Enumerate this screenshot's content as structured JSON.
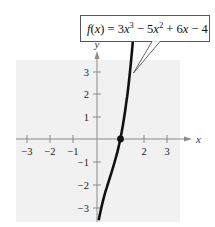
{
  "chart_data": {
    "type": "line",
    "title": "",
    "function_label": "f(x) = 3x^3 − 5x^2 + 6x − 4",
    "function_label_parts": {
      "lhs": "f(x) = 3x",
      "exp1": "3",
      "mid": " − 5x",
      "exp2": "2",
      "rhs": " + 6x − 4"
    },
    "xlabel": "x",
    "ylabel": "y",
    "xlim": [
      -3.5,
      4
    ],
    "ylim": [
      -3.5,
      4
    ],
    "x_ticks": [
      -3,
      -2,
      -1,
      1,
      2,
      3
    ],
    "y_ticks": [
      -3,
      -2,
      -1,
      1,
      2,
      3
    ],
    "x_tick_labels": [
      "−3",
      "−2",
      "−1",
      "2",
      "3"
    ],
    "y_tick_labels": [
      "3",
      "2",
      "1",
      "−1",
      "−2",
      "−3"
    ],
    "grid": false,
    "series": [
      {
        "name": "f(x) = 3x^3 − 5x^2 + 6x − 4",
        "x": [
          0.02,
          0.2,
          0.4,
          0.6,
          0.8,
          1.0,
          1.2,
          1.4,
          1.58
        ],
        "y": [
          -3.88,
          -2.98,
          -2.21,
          -1.5,
          -0.78,
          0.0,
          0.98,
          2.23,
          3.5
        ]
      }
    ],
    "highlighted_points": [
      {
        "x": 1,
        "y": 0,
        "label": "x-intercept"
      }
    ],
    "annotations": [
      {
        "text": "f(x) = 3x^3 − 5x^2 + 6x − 4",
        "points_to": {
          "x": 1.55,
          "y": 2.9
        }
      }
    ],
    "colors": {
      "curve": "#111111",
      "axes": "#8a8a8a",
      "plot_background": "#f1f1f1",
      "callout_border": "#555555"
    }
  }
}
